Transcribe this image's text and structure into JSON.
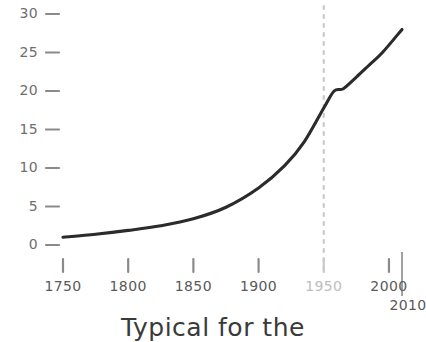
{
  "caption": "Typical for the",
  "colors": {
    "line": "#2b2b2b",
    "tick": "#8a8a8a",
    "y_label": "#6e6e6e",
    "x_label": "#5a5a5a",
    "x_label_muted": "#bdbdbd",
    "marker_line": "#c9c9c9",
    "axis": "#8a8a8a",
    "background": "#ffffff"
  },
  "chart_data": {
    "type": "line",
    "title": "",
    "xlabel": "",
    "ylabel": "",
    "xlim": [
      1750,
      2010
    ],
    "ylim": [
      0,
      30
    ],
    "grid": false,
    "legend": null,
    "x_ticks": [
      "1750",
      "1800",
      "1850",
      "1900",
      "1950",
      "2000"
    ],
    "x_tick_values": [
      1750,
      1800,
      1850,
      1900,
      1950,
      2000
    ],
    "x_axis_end_label": "2010",
    "y_ticks": [
      "0",
      "5",
      "10",
      "15",
      "20",
      "25",
      "30"
    ],
    "y_tick_values": [
      0,
      5,
      10,
      15,
      20,
      25,
      30
    ],
    "annotations": [
      {
        "name": "year-1950-marker",
        "type": "vline",
        "x": 1950,
        "style": "dashed",
        "label": "1950"
      }
    ],
    "series": [
      {
        "name": "growth-curve",
        "x": [
          1750,
          1775,
          1800,
          1825,
          1850,
          1875,
          1900,
          1920,
          1935,
          1950,
          1958,
          1965,
          1975,
          1985,
          1995,
          2010
        ],
        "values": [
          1.0,
          1.4,
          1.9,
          2.5,
          3.4,
          4.9,
          7.4,
          10.3,
          13.4,
          17.8,
          20.0,
          20.3,
          21.8,
          23.4,
          25.0,
          28.0
        ]
      }
    ]
  }
}
